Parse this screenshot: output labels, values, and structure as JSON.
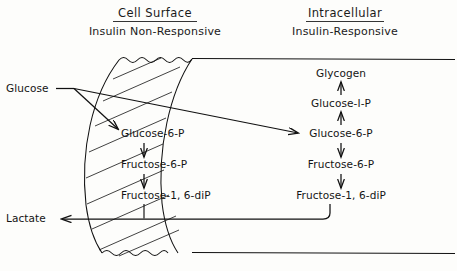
{
  "figure": {
    "background_color": "#fdfdfb",
    "line_color": "#111111",
    "text_color": "#141414"
  },
  "headers": {
    "left": {
      "title": "Cell  Surface",
      "subtitle": "Insulin  Non-Responsive"
    },
    "right": {
      "title": "Intracellular",
      "subtitle": "Insulin-Responsive"
    }
  },
  "external": {
    "glucose": "Glucose",
    "lactate": "Lactate"
  },
  "surface_pathway": {
    "steps": [
      "Glucose-6-P",
      "Fructose-6-P",
      "Fructose-1, 6-diP"
    ]
  },
  "intracellular_pathway": {
    "steps": [
      "Glycogen",
      "Glucose-I-P",
      "Glucose-6-P",
      "Fructose-6-P",
      "Fructose-1, 6-diP"
    ]
  },
  "arrows": {
    "glucose_to_surface_g6p": "glucose-to-surface-glucose-6-p",
    "glucose_to_intracellular_g6p": "glucose-to-intracellular-glucose-6-p",
    "surface_g6p_to_f6p": "down-arrow",
    "surface_f6p_to_fdp": "down-arrow",
    "intracellular_g1p_to_glycogen": "up-arrow",
    "intracellular_g6p_to_g1p": "up-arrow",
    "intracellular_g6p_to_f6p": "down-arrow",
    "intracellular_f6p_to_fdp": "down-arrow",
    "fdp_to_lactate": "left-arrow"
  }
}
